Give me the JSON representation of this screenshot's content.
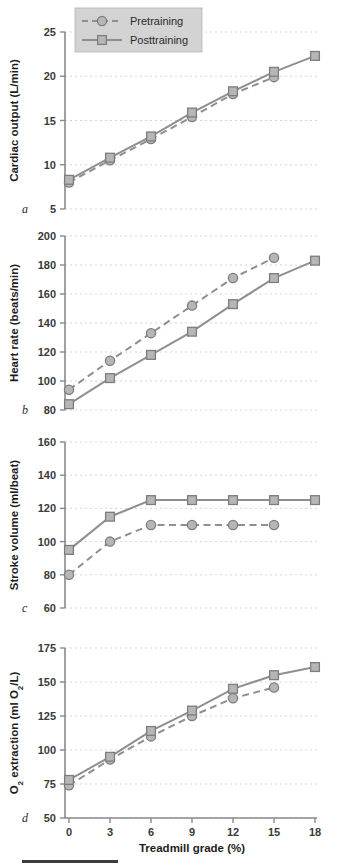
{
  "figure": {
    "legend": {
      "pretraining_label": "Pretraining",
      "posttraining_label": "Posttraining"
    },
    "xaxis": {
      "label": "Treadmill grade (%)",
      "ticks": [
        "0",
        "3",
        "6",
        "9",
        "12",
        "15",
        "18"
      ],
      "values": [
        0,
        3,
        6,
        9,
        12,
        15,
        18
      ]
    },
    "panels": [
      {
        "letter": "a",
        "ylabel": "Cardiac output (L/min)",
        "yticks": [
          "5",
          "10",
          "15",
          "20",
          "25"
        ],
        "ytickvalues": [
          5,
          10,
          15,
          20,
          25
        ]
      },
      {
        "letter": "b",
        "ylabel": "Heart rate (beats/min)",
        "yticks": [
          "80",
          "100",
          "120",
          "140",
          "160",
          "180",
          "200"
        ],
        "ytickvalues": [
          80,
          100,
          120,
          140,
          160,
          180,
          200
        ]
      },
      {
        "letter": "c",
        "ylabel": "Stroke volume (ml/beat)",
        "yticks": [
          "60",
          "80",
          "100",
          "120",
          "140",
          "160"
        ],
        "ytickvalues": [
          60,
          80,
          100,
          120,
          140,
          160
        ]
      },
      {
        "letter": "d",
        "ylabel_parts": [
          "O",
          "2",
          " extraction (ml O",
          "2",
          "/L)"
        ],
        "ylabel": "O2 extraction (ml O2/L)",
        "yticks": [
          "50",
          "75",
          "100",
          "125",
          "150",
          "175"
        ],
        "ytickvalues": [
          50,
          75,
          100,
          125,
          150,
          175
        ]
      }
    ]
  },
  "chart_data": [
    {
      "type": "line",
      "panel": "a",
      "title": "",
      "xlabel": "Treadmill grade (%)",
      "ylabel": "Cardiac output (L/min)",
      "x": [
        0,
        3,
        6,
        9,
        12,
        15,
        18
      ],
      "xlim": [
        -1.2,
        19
      ],
      "ylim": [
        5,
        25
      ],
      "grid": true,
      "legend_position": "top-left",
      "series": [
        {
          "name": "Pretraining",
          "x": [
            0,
            3,
            6,
            9,
            12,
            15
          ],
          "values": [
            8.0,
            10.5,
            12.9,
            15.4,
            18.0,
            19.9
          ]
        },
        {
          "name": "Posttraining",
          "x": [
            0,
            3,
            6,
            9,
            12,
            15,
            18
          ],
          "values": [
            8.3,
            10.8,
            13.2,
            15.9,
            18.3,
            20.5,
            22.3
          ]
        }
      ]
    },
    {
      "type": "line",
      "panel": "b",
      "title": "",
      "xlabel": "Treadmill grade (%)",
      "ylabel": "Heart rate (beats/min)",
      "x": [
        0,
        3,
        6,
        9,
        12,
        15,
        18
      ],
      "xlim": [
        -1.2,
        19
      ],
      "ylim": [
        80,
        200
      ],
      "grid": true,
      "series": [
        {
          "name": "Pretraining",
          "x": [
            0,
            3,
            6,
            9,
            12,
            15
          ],
          "values": [
            94,
            114,
            133,
            152,
            171,
            185
          ]
        },
        {
          "name": "Posttraining",
          "x": [
            0,
            3,
            6,
            9,
            12,
            15,
            18
          ],
          "values": [
            84,
            102,
            118,
            134,
            153,
            171,
            183
          ]
        }
      ]
    },
    {
      "type": "line",
      "panel": "c",
      "title": "",
      "xlabel": "Treadmill grade (%)",
      "ylabel": "Stroke volume (ml/beat)",
      "x": [
        0,
        3,
        6,
        9,
        12,
        15,
        18
      ],
      "xlim": [
        -1.2,
        19
      ],
      "ylim": [
        60,
        160
      ],
      "grid": true,
      "series": [
        {
          "name": "Pretraining",
          "x": [
            0,
            3,
            6,
            9,
            12,
            15
          ],
          "values": [
            80,
            100,
            110,
            110,
            110,
            110
          ]
        },
        {
          "name": "Posttraining",
          "x": [
            0,
            3,
            6,
            9,
            12,
            15,
            18
          ],
          "values": [
            95,
            115,
            125,
            125,
            125,
            125,
            125
          ]
        }
      ]
    },
    {
      "type": "line",
      "panel": "d",
      "title": "",
      "xlabel": "Treadmill grade (%)",
      "ylabel": "O2 extraction (ml O2/L)",
      "x": [
        0,
        3,
        6,
        9,
        12,
        15,
        18
      ],
      "xlim": [
        -1.2,
        19
      ],
      "ylim": [
        50,
        175
      ],
      "grid": true,
      "series": [
        {
          "name": "Pretraining",
          "x": [
            0,
            3,
            6,
            9,
            12,
            15
          ],
          "values": [
            74,
            93,
            110,
            125,
            138,
            146
          ]
        },
        {
          "name": "Posttraining",
          "x": [
            0,
            3,
            6,
            9,
            12,
            15,
            18
          ],
          "values": [
            78,
            95,
            114,
            129,
            145,
            155,
            161
          ]
        }
      ]
    }
  ]
}
